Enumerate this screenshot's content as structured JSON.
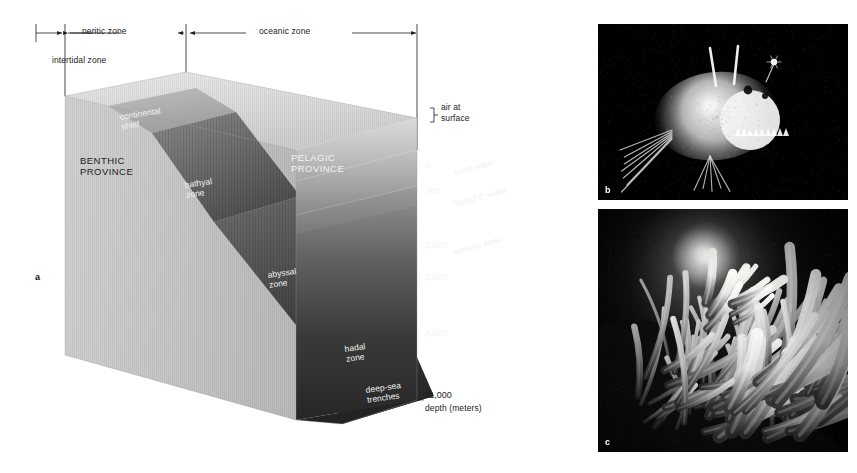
{
  "figure": {
    "panels": [
      {
        "id": "a",
        "letter": "a",
        "kind": "block-diagram"
      },
      {
        "id": "b",
        "letter": "b",
        "kind": "photograph"
      },
      {
        "id": "c",
        "letter": "c",
        "kind": "photograph"
      }
    ]
  },
  "top_scale": {
    "zones": [
      {
        "name": "intertidal zone",
        "label": "intertidal zone"
      },
      {
        "name": "neritic zone",
        "label": "neritic zone"
      },
      {
        "name": "oceanic zone",
        "label": "oceanic zone"
      }
    ]
  },
  "provinces": [
    {
      "label": "BENTHIC\nPROVINCE",
      "line1": "BENTHIC",
      "line2": "PROVINCE",
      "color": "#1d1d1d"
    },
    {
      "label": "PELAGIC\nPROVINCE",
      "line1": "PELAGIC",
      "line2": "PROVINCE",
      "color": "#f2f2f2"
    }
  ],
  "benthic_zones": [
    {
      "line1": "continental",
      "line2": "shelf"
    },
    {
      "line1": "bathyal",
      "line2": "zone"
    },
    {
      "line1": "abyssal",
      "line2": "zone"
    },
    {
      "line1": "hadal",
      "line2": "zone"
    },
    {
      "line1": "deep-sea",
      "line2": "trenches"
    }
  ],
  "water_layers": [
    {
      "label": "sunlit water",
      "depth_range": "0-200"
    },
    {
      "label": "\"twilight\" water",
      "depth_range": "200-1,000"
    },
    {
      "label": "sunless water",
      "depth_range": "1,000-11,000"
    }
  ],
  "depth_scale": {
    "axis_label": "depth (meters)",
    "ticks": [
      "0",
      "200",
      "1,000",
      "2,000",
      "4,000",
      "11,000"
    ]
  },
  "surface_note": {
    "line1": "air at",
    "line2": "surface"
  },
  "colors": {
    "ink": "#1d1d1d",
    "label_light": "#f2f2f2",
    "photo_bg": "#000000",
    "water_top": "#d8d8d8",
    "water_deep": "#2a2a2a"
  }
}
